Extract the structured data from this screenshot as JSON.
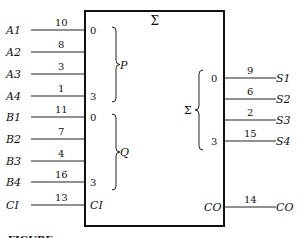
{
  "symbol": {
    "title": "Σ",
    "box": {
      "x": 85,
      "y": 11,
      "w": 139,
      "h": 215
    }
  },
  "inputs": [
    {
      "signal": "A1",
      "pin": "10",
      "y": 30,
      "inner": "0"
    },
    {
      "signal": "A2",
      "pin": "8",
      "y": 52,
      "inner": ""
    },
    {
      "signal": "A3",
      "pin": "3",
      "y": 74,
      "inner": ""
    },
    {
      "signal": "A4",
      "pin": "1",
      "y": 96,
      "inner": "3"
    },
    {
      "signal": "B1",
      "pin": "11",
      "y": 117,
      "inner": "0"
    },
    {
      "signal": "B2",
      "pin": "7",
      "y": 139,
      "inner": ""
    },
    {
      "signal": "B3",
      "pin": "4",
      "y": 161,
      "inner": ""
    },
    {
      "signal": "B4",
      "pin": "16",
      "y": 182,
      "inner": "3"
    },
    {
      "signal": "CI",
      "pin": "13",
      "y": 205,
      "inner": "CI"
    }
  ],
  "outputs": [
    {
      "signal": "S1",
      "pin": "9",
      "y": 78,
      "inner": "0"
    },
    {
      "signal": "S2",
      "pin": "6",
      "y": 99,
      "inner": ""
    },
    {
      "signal": "S3",
      "pin": "2",
      "y": 120,
      "inner": ""
    },
    {
      "signal": "S4",
      "pin": "15",
      "y": 141,
      "inner": "3"
    },
    {
      "signal": "CO",
      "pin": "14",
      "y": 207,
      "inner": "CO"
    }
  ],
  "groups": [
    {
      "label": "P",
      "side": "left",
      "y1": 27,
      "y2": 102
    },
    {
      "label": "Q",
      "side": "left",
      "y1": 114,
      "y2": 190
    },
    {
      "label": "Σ",
      "side": "right",
      "y1": 70,
      "y2": 150
    }
  ],
  "caption": "FIGURE"
}
